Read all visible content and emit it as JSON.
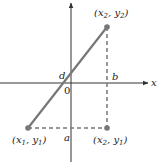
{
  "diagram": {
    "type": "coordinate-plane",
    "colors": {
      "axis": "#333333",
      "segment": "#777777",
      "dashed": "#777777",
      "point": "#777777",
      "text": "#222222"
    },
    "axes": {
      "x_label": "x",
      "y_label": "y",
      "origin_label": "0"
    },
    "points": [
      {
        "name": "p1",
        "label_main": "x",
        "label_sub1": "1",
        "label_sep": ", ",
        "label_main2": "y",
        "label_sub2": "1"
      },
      {
        "name": "p2",
        "label_main": "x",
        "label_sub1": "2",
        "label_sep": ", ",
        "label_main2": "y",
        "label_sub2": "2"
      },
      {
        "name": "p3",
        "label_main": "x",
        "label_sub1": "2",
        "label_sep": ", ",
        "label_main2": "y",
        "label_sub2": "1"
      }
    ],
    "segment_labels": {
      "a": "a",
      "b": "b",
      "d": "d"
    }
  }
}
